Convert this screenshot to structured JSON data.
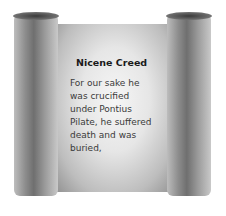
{
  "scroll": {
    "title": "Nicene Creed",
    "lines": [
      "For our sake he",
      "was crucified",
      "under Pontius",
      "Pilate, he suffered",
      "death and was",
      "buried,"
    ]
  }
}
